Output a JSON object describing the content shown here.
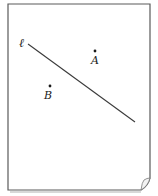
{
  "diagram": {
    "type": "geometry-figure",
    "line": {
      "label": "ℓ",
      "start": {
        "x": 28,
        "y": 44
      },
      "end": {
        "x": 135,
        "y": 122
      },
      "color": "#3a3a3a"
    },
    "points": [
      {
        "label": "A",
        "x": 95,
        "y": 51,
        "label_x": 92,
        "label_y": 63
      },
      {
        "label": "B",
        "x": 50,
        "y": 86,
        "label_x": 45,
        "label_y": 98
      }
    ],
    "paper": {
      "border_color": "#555555",
      "background": "#ffffff",
      "has_page_curl": true
    }
  }
}
